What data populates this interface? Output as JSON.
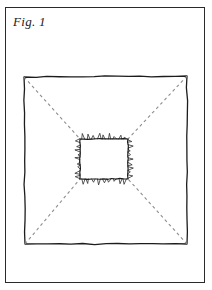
{
  "figure": {
    "label": "Fig. 1",
    "type": "technical-line-drawing",
    "background_color": "#ffffff",
    "ink_color": "#1c1c1c",
    "dash_color": "#8d8d8d",
    "canvas": {
      "width": 212,
      "height": 290
    },
    "elements": {
      "frame": {
        "name": "outer-frame",
        "shape": "rectangle",
        "stroke_color": "#2a2a2a",
        "stroke_width": 1,
        "x": 5.5,
        "y": 7.5,
        "width": 199,
        "height": 275
      },
      "outer_square": {
        "name": "outer-square",
        "shape": "hand-drawn-square",
        "stroke_color": "#1c1c1c",
        "stroke_width": 1.3,
        "corners": [
          {
            "x": 24,
            "y": 77
          },
          {
            "x": 187,
            "y": 76
          },
          {
            "x": 187,
            "y": 244
          },
          {
            "x": 25,
            "y": 244
          }
        ]
      },
      "inner_square": {
        "name": "inner-jagged-square",
        "shape": "spiked-square",
        "stroke_color": "#1c1c1c",
        "stroke_width": 1.2,
        "spike_color": "#2e2e2e",
        "spike_width": 0.8,
        "spike_direction": "outward",
        "spikes_per_edge": 9,
        "spike_length_min": 2,
        "spike_length_max": 6,
        "corners": [
          {
            "x": 80,
            "y": 139
          },
          {
            "x": 128,
            "y": 139
          },
          {
            "x": 128,
            "y": 179
          },
          {
            "x": 80,
            "y": 179
          }
        ]
      },
      "diagonals": {
        "name": "dashed-diagonals",
        "style": "dashed",
        "stroke_color": "#8d8d8d",
        "stroke_width": 1.1,
        "dash_pattern": "3 3",
        "lines": [
          {
            "name": "diagonal-top-left",
            "x1": 24,
            "y1": 77,
            "x2": 80,
            "y2": 139
          },
          {
            "name": "diagonal-top-right",
            "x1": 187,
            "y1": 76,
            "x2": 128,
            "y2": 139
          },
          {
            "name": "diagonal-bottom-right",
            "x1": 187,
            "y1": 244,
            "x2": 128,
            "y2": 179
          },
          {
            "name": "diagonal-bottom-left",
            "x1": 25,
            "y1": 244,
            "x2": 80,
            "y2": 179
          }
        ]
      }
    }
  }
}
